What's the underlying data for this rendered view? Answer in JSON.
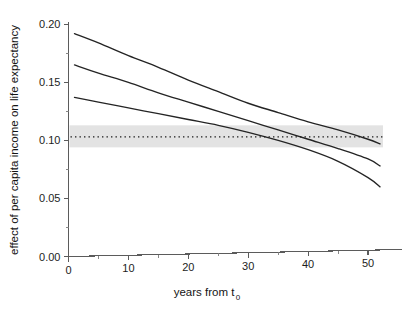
{
  "chart_data": {
    "type": "line",
    "title": "",
    "subtitle": "",
    "xlabel": "years from t",
    "xlabel_subscript": "0",
    "xlabel_full": "years from t0",
    "ylabel": "effect of per capita income on life expectancy",
    "xlim": [
      0,
      54
    ],
    "ylim": [
      0.0,
      0.202
    ],
    "grid": false,
    "legend_position": "none",
    "x_ticks": [
      0,
      10,
      20,
      30,
      40,
      50
    ],
    "x_tick_labels": [
      "0",
      "10",
      "20",
      "30",
      "40",
      "50"
    ],
    "x_minor_ticks": [
      5,
      15,
      25,
      35,
      45
    ],
    "y_ticks": [
      0.0,
      0.05,
      0.1,
      0.15,
      0.2
    ],
    "y_tick_labels": [
      "0.00",
      "0.05",
      "0.10",
      "0.15",
      "0.20"
    ],
    "y_minor_ticks": [
      0.025,
      0.075,
      0.125,
      0.175
    ],
    "x": [
      1,
      5,
      10,
      15,
      20,
      25,
      30,
      35,
      40,
      45,
      50,
      52
    ],
    "series": [
      {
        "name": "upper confidence bound",
        "style": "solid",
        "color": "#242424",
        "values": [
          0.192,
          0.184,
          0.173,
          0.163,
          0.152,
          0.142,
          0.132,
          0.124,
          0.116,
          0.109,
          0.101,
          0.097
        ]
      },
      {
        "name": "point estimate",
        "style": "solid",
        "color": "#242424",
        "values": [
          0.165,
          0.158,
          0.15,
          0.141,
          0.133,
          0.125,
          0.117,
          0.109,
          0.101,
          0.093,
          0.084,
          0.078
        ]
      },
      {
        "name": "lower confidence bound",
        "style": "solid",
        "color": "#242424",
        "values": [
          0.137,
          0.133,
          0.128,
          0.123,
          0.118,
          0.113,
          0.107,
          0.1,
          0.092,
          0.082,
          0.068,
          0.06
        ]
      }
    ],
    "reference_line": {
      "name": "pooled estimate",
      "style": "dotted",
      "value": 0.103,
      "color": "#1a1a1a"
    },
    "reference_band": {
      "name": "pooled estimate confidence band",
      "lower": 0.094,
      "upper": 0.113,
      "color": "#e3e3e3"
    },
    "colors": {
      "curve": "#242424",
      "band": "#e3e3e3",
      "axis": "#5b5b5b",
      "background": "#ffffff"
    }
  }
}
